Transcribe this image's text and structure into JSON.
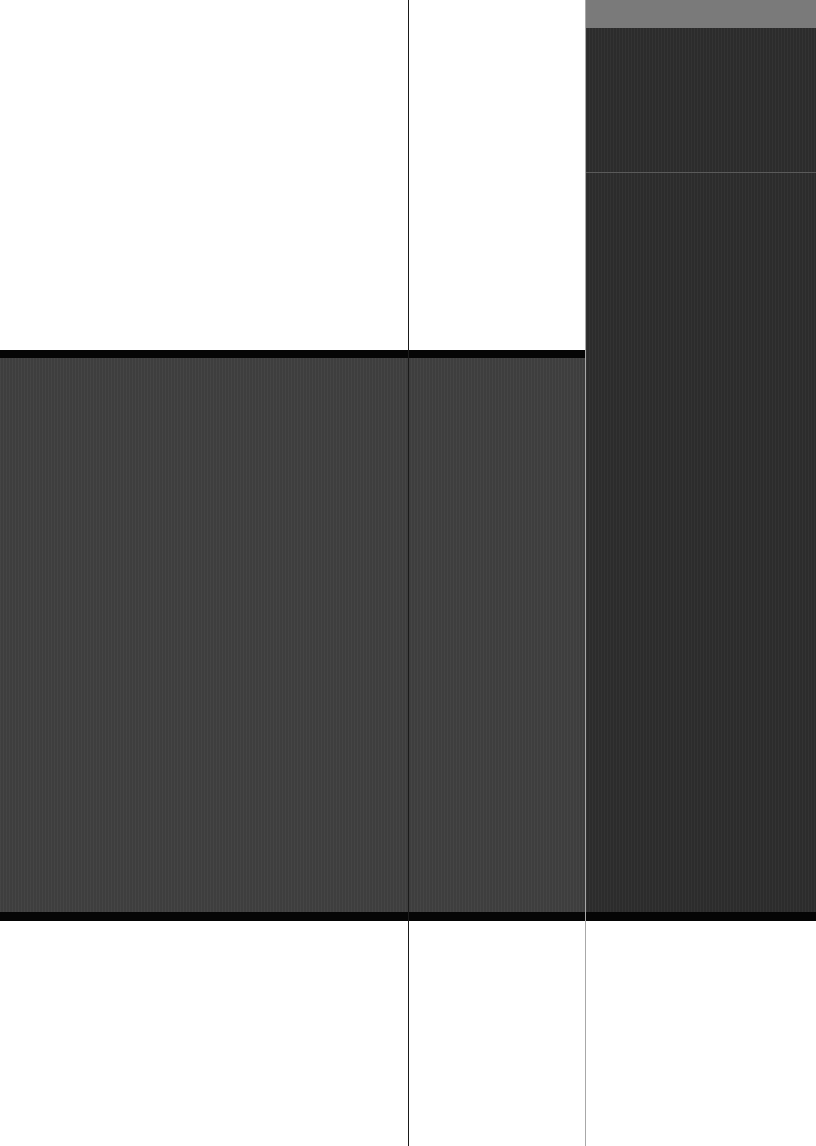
{
  "canvas": {
    "width": 816,
    "height": 1146,
    "background": "#ffffff"
  },
  "colors": {
    "top_right_band": "#7a7a7a",
    "right_column": "#2c2c2c",
    "center_band": "#3e3e3e",
    "band_border": "#050505",
    "vertical_line": "#1a1a1a",
    "right_divider": "#a8a8a8",
    "horizontal_hairline": "#5a5a5a"
  },
  "shapes": {
    "top_right_band": {
      "x": 586,
      "y": 0,
      "w": 230,
      "h": 28
    },
    "right_column": {
      "x": 586,
      "y": 28,
      "w": 230,
      "h": 885
    },
    "right_column_hairline": {
      "x": 586,
      "y": 172,
      "w": 230,
      "h": 1
    },
    "center_band": {
      "x": 0,
      "y": 357,
      "w": 586,
      "h": 556
    },
    "center_band_top_border": {
      "x": 0,
      "y": 350,
      "w": 586,
      "h": 8
    },
    "center_band_bottom_border": {
      "x": 0,
      "y": 912,
      "w": 816,
      "h": 9
    },
    "vertical_line_left": {
      "x": 408,
      "y": 0,
      "w": 1,
      "h": 1146
    },
    "vertical_line_right": {
      "x": 585,
      "y": 0,
      "w": 1,
      "h": 1146
    }
  }
}
